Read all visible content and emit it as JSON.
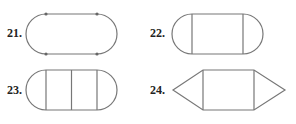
{
  "figures": [
    {
      "number": "21.",
      "shape": "stadium-with-vertices",
      "description": "Rectangle with semicircular ends, four vertex points"
    },
    {
      "number": "22.",
      "shape": "stadium-one-rect",
      "description": "Rectangle with semicircular ends, one rectangle region"
    },
    {
      "number": "23.",
      "shape": "stadium-two-rects",
      "description": "Semicircular ends with two rectangle regions"
    },
    {
      "number": "24.",
      "shape": "hexagon-rect-triangles",
      "description": "Rectangle with triangle on each end"
    }
  ],
  "colors": {
    "stroke": "#777777",
    "label": "#222222",
    "background": "#ffffff"
  }
}
